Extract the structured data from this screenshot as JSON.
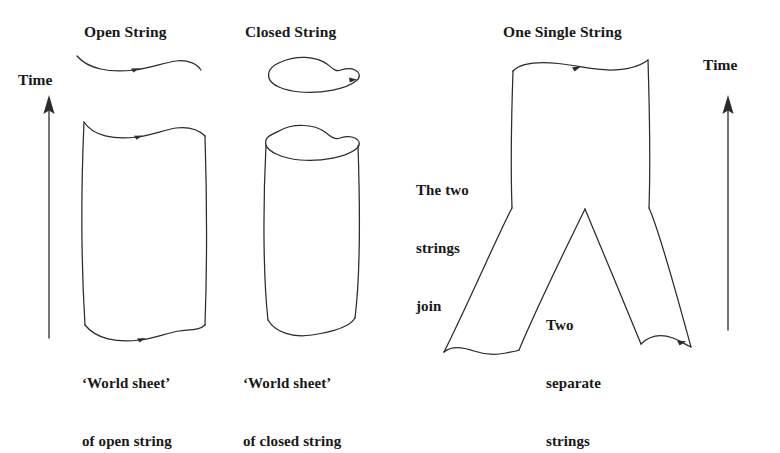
{
  "figure": {
    "title_open_string": "Open String",
    "title_closed_string": "Closed String",
    "title_one_single_string": "One Single String",
    "time_axis_left": "Time",
    "time_axis_right": "Time",
    "caption_open_sheet_line1": "‘World sheet’",
    "caption_open_sheet_line2": "of open string",
    "caption_closed_sheet_line1": "‘World sheet’",
    "caption_closed_sheet_line2": "of closed string",
    "note_join_line1": "The two",
    "note_join_line2": "strings",
    "note_join_line3": "join",
    "note_separate_line1": "Two",
    "note_separate_line2": "separate",
    "note_separate_line3": "strings",
    "ink_color": "#2b2b2b",
    "background_color": "#ffffff",
    "text_color": "#181818"
  }
}
